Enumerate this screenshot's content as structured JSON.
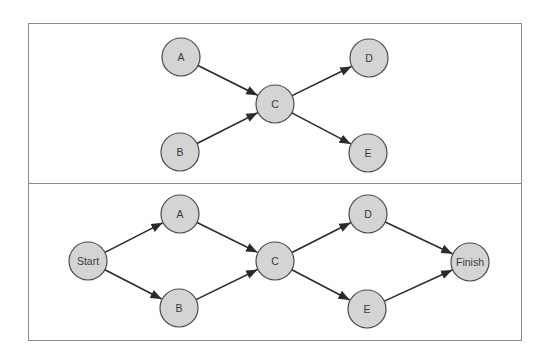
{
  "colors": {
    "node_fill": "#d4d4d4",
    "node_stroke": "#4a4a4a",
    "edge": "#2a2a2a",
    "frame": "#8a8a8a"
  },
  "top_panel": {
    "nodes": [
      {
        "id": "A",
        "label": "A",
        "x": 181,
        "y": 57
      },
      {
        "id": "B",
        "label": "B",
        "x": 180,
        "y": 152
      },
      {
        "id": "C",
        "label": "C",
        "x": 275,
        "y": 104
      },
      {
        "id": "D",
        "label": "D",
        "x": 369,
        "y": 58
      },
      {
        "id": "E",
        "label": "E",
        "x": 368,
        "y": 153
      }
    ],
    "edges": [
      [
        "A",
        "C"
      ],
      [
        "B",
        "C"
      ],
      [
        "C",
        "D"
      ],
      [
        "C",
        "E"
      ]
    ]
  },
  "bottom_panel": {
    "nodes": [
      {
        "id": "Start",
        "label": "Start",
        "x": 88,
        "y": 261
      },
      {
        "id": "A",
        "label": "A",
        "x": 180,
        "y": 214
      },
      {
        "id": "B",
        "label": "B",
        "x": 179,
        "y": 308
      },
      {
        "id": "C",
        "label": "C",
        "x": 275,
        "y": 261
      },
      {
        "id": "D",
        "label": "D",
        "x": 368,
        "y": 214
      },
      {
        "id": "E",
        "label": "E",
        "x": 367,
        "y": 309
      },
      {
        "id": "Finish",
        "label": "Finish",
        "x": 470,
        "y": 262
      }
    ],
    "edges": [
      [
        "Start",
        "A"
      ],
      [
        "Start",
        "B"
      ],
      [
        "A",
        "C"
      ],
      [
        "B",
        "C"
      ],
      [
        "C",
        "D"
      ],
      [
        "C",
        "E"
      ],
      [
        "D",
        "Finish"
      ],
      [
        "E",
        "Finish"
      ]
    ]
  }
}
